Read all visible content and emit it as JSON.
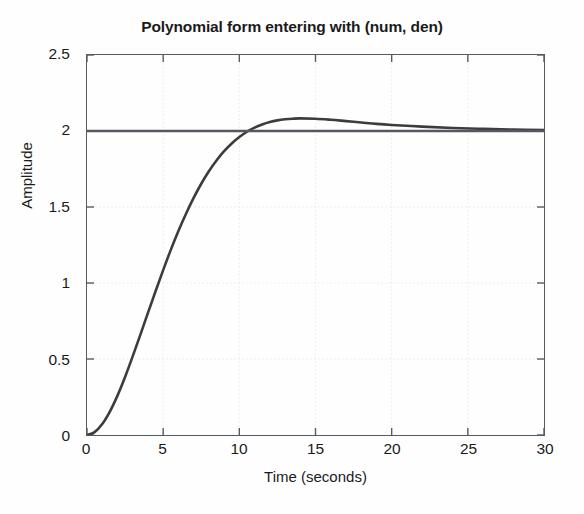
{
  "chart_data": {
    "type": "line",
    "title": "Polynomial form entering with (num, den)",
    "xlabel": "Time (seconds)",
    "ylabel": "Amplitude",
    "xlim": [
      0,
      30
    ],
    "ylim": [
      0,
      2.5
    ],
    "xticks": [
      "0",
      "5",
      "10",
      "15",
      "20",
      "25",
      "30"
    ],
    "xtick_values": [
      0,
      5,
      10,
      15,
      20,
      25,
      30
    ],
    "yticks": [
      "0",
      "0.5",
      "1",
      "1.5",
      "2",
      "2.5"
    ],
    "ytick_values": [
      0,
      0.5,
      1,
      1.5,
      2,
      2.5
    ],
    "grid": true,
    "legend": "none",
    "series": [
      {
        "name": "step response",
        "color": "#3c3c3c",
        "linewidth": 2.6,
        "x": [
          0,
          0.5,
          1,
          1.5,
          2,
          2.5,
          3,
          3.5,
          4,
          4.5,
          5,
          5.5,
          6,
          6.5,
          7,
          7.5,
          8,
          8.5,
          9,
          9.5,
          10,
          10.5,
          11,
          11.5,
          12,
          12.5,
          13,
          13.5,
          14,
          15,
          16,
          17,
          18,
          19,
          20,
          22,
          24,
          26,
          28,
          30
        ],
        "y": [
          0,
          0.019,
          0.072,
          0.154,
          0.259,
          0.382,
          0.517,
          0.659,
          0.803,
          0.946,
          1.085,
          1.218,
          1.342,
          1.456,
          1.56,
          1.653,
          1.735,
          1.806,
          1.867,
          1.918,
          1.96,
          1.995,
          2.022,
          2.043,
          2.059,
          2.07,
          2.077,
          2.081,
          2.083,
          2.081,
          2.074,
          2.065,
          2.056,
          2.047,
          2.04,
          2.029,
          2.02,
          2.014,
          2.009,
          2.006
        ]
      },
      {
        "name": "final value reference",
        "color": "#55585c",
        "linewidth": 2.4,
        "x": [
          0,
          30
        ],
        "y": [
          2,
          2
        ]
      }
    ],
    "peak_value": 2.083,
    "peak_time": 12.6,
    "final_value": 2.0
  },
  "figure": {
    "title": "Polynomial form entering with (num, den)",
    "x_axis_title": "Time (seconds)",
    "y_axis_title": "Amplitude",
    "axis_color": "#555a5e",
    "grid_color": "#e9e9e9",
    "background": "#fefefe"
  }
}
